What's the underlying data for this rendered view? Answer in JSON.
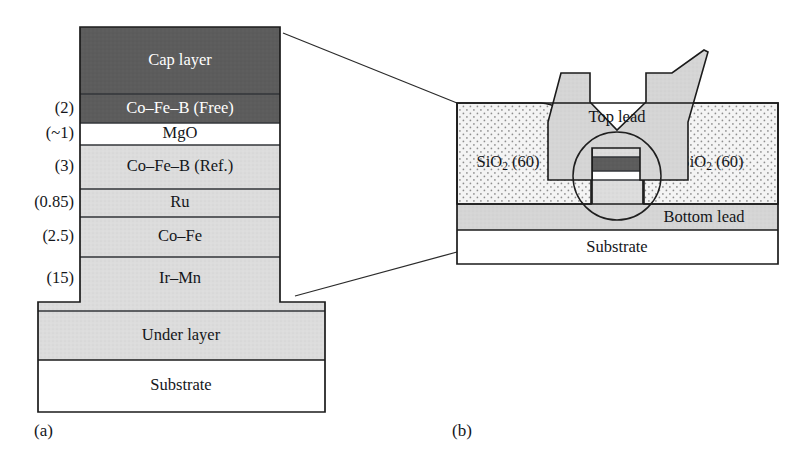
{
  "figure": {
    "panel_a": {
      "caption": "(a)",
      "layers": [
        {
          "name": "Cap layer",
          "thickness": "",
          "shade": "dark",
          "text_color": "light"
        },
        {
          "name": "Co–Fe–B (Free)",
          "thickness": "(2)",
          "shade": "dark",
          "text_color": "light"
        },
        {
          "name": "MgO",
          "thickness": "(~1)",
          "shade": "white",
          "text_color": "dark"
        },
        {
          "name": "Co–Fe–B (Ref.)",
          "thickness": "(3)",
          "shade": "light",
          "text_color": "dark"
        },
        {
          "name": "Ru",
          "thickness": "(0.85)",
          "shade": "light",
          "text_color": "dark"
        },
        {
          "name": "Co–Fe",
          "thickness": "(2.5)",
          "shade": "light",
          "text_color": "dark"
        },
        {
          "name": "Ir–Mn",
          "thickness": "(15)",
          "shade": "light",
          "text_color": "dark"
        },
        {
          "name": "Under layer",
          "thickness": "",
          "shade": "light",
          "text_color": "dark"
        },
        {
          "name": "Substrate",
          "thickness": "",
          "shade": "white",
          "text_color": "dark"
        }
      ]
    },
    "panel_b": {
      "caption": "(b)",
      "top_lead": "Top lead",
      "oxide_left": {
        "formula": "SiO",
        "subscript": "2",
        "thickness": "(60)"
      },
      "oxide_right": {
        "formula": "SiO",
        "subscript": "2",
        "thickness": "(60)"
      },
      "bottom_lead": "Bottom lead",
      "substrate": "Substrate"
    }
  },
  "colors": {
    "dark_layer": "#595959",
    "light_layer": "#d9d9d9",
    "white_layer": "#ffffff",
    "oxide_fill": "#f0f0f0",
    "lead_fill": "#d4d4d4",
    "outline": "#1b1b1b",
    "text_dark": "#14161a",
    "text_light": "#ffffff"
  }
}
